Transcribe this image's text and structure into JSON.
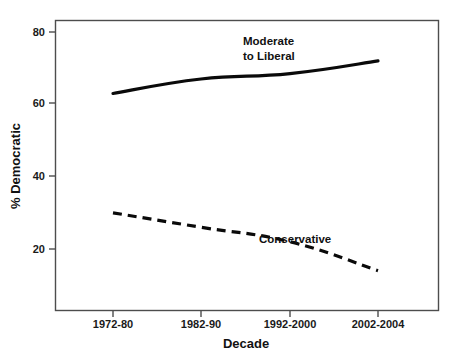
{
  "chart_data": {
    "type": "line",
    "title": "",
    "xlabel": "Decade",
    "ylabel": "% Democratic",
    "categories": [
      "1972-80",
      "1982-90",
      "1992-2000",
      "2002-2004"
    ],
    "ylim": [
      10,
      85
    ],
    "yticks": [
      20,
      40,
      60,
      80
    ],
    "ytick_labels": [
      "20",
      "40",
      "60",
      "80"
    ],
    "grid": false,
    "legend_position": "inline-annotation",
    "series": [
      {
        "name": "Moderate to Liberal",
        "style": "solid",
        "color": "#0a0a0a",
        "values": [
          63,
          67,
          68.5,
          72
        ],
        "annotation": {
          "line1": "Moderate",
          "line2": "to Liberal"
        }
      },
      {
        "name": "Conservative",
        "style": "dashed",
        "color": "#0a0a0a",
        "values": [
          30,
          26,
          22,
          14
        ],
        "annotation": {
          "line1": "Conservative",
          "line2": ""
        }
      }
    ]
  },
  "axes": {
    "y_tick_80": "80",
    "y_tick_60": "60",
    "y_tick_40": "40",
    "y_tick_20": "20",
    "y_axis_title": "% Democratic",
    "x_tick_1": "1972-80",
    "x_tick_2": "1982-90",
    "x_tick_3": "1992-2000",
    "x_tick_4": "2002-2004",
    "x_axis_title": "Decade"
  },
  "annotations": {
    "moderate_line1": "Moderate",
    "moderate_line2": "to Liberal",
    "conservative": "Conservative"
  },
  "colors": {
    "series_line": "#0a0a0a",
    "frame": "#4d4d4d",
    "text": "#111111",
    "background": "#ffffff"
  }
}
